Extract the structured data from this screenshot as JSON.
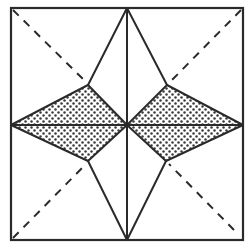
{
  "diagram": {
    "title": "",
    "colors": {
      "background": "#ffffff",
      "stroke": "#2a2a2a",
      "dots": "#3a3a3a"
    },
    "square": {
      "x1": 11,
      "y1": 8,
      "x2": 243,
      "y2": 240
    },
    "center": {
      "x": 127,
      "y": 125
    },
    "inner_vertices": {
      "upper_left": {
        "x": 88,
        "y": 85
      },
      "upper_right": {
        "x": 167,
        "y": 85
      },
      "lower_left": {
        "x": 88,
        "y": 161
      },
      "lower_right": {
        "x": 166,
        "y": 161
      }
    },
    "shaded_regions": [
      {
        "name": "left-diamond",
        "points": "11,125 88,85 127,125 88,161"
      },
      {
        "name": "right-diamond",
        "points": "127,125 167,85 243,125 166,161"
      }
    ],
    "solid_lines": [
      {
        "name": "vertical-center-line",
        "x1": 127,
        "y1": 8,
        "x2": 127,
        "y2": 240
      },
      {
        "name": "horizontal-center-line",
        "x1": 11,
        "y1": 125,
        "x2": 243,
        "y2": 125
      },
      {
        "name": "top-to-upper-left",
        "x1": 127,
        "y1": 8,
        "x2": 88,
        "y2": 85
      },
      {
        "name": "top-to-upper-right",
        "x1": 127,
        "y1": 8,
        "x2": 167,
        "y2": 85
      },
      {
        "name": "bottom-to-lower-left",
        "x1": 127,
        "y1": 240,
        "x2": 88,
        "y2": 161
      },
      {
        "name": "bottom-to-lower-right",
        "x1": 127,
        "y1": 240,
        "x2": 166,
        "y2": 161
      },
      {
        "name": "left-to-upper-left",
        "x1": 11,
        "y1": 125,
        "x2": 88,
        "y2": 85
      },
      {
        "name": "left-to-lower-left",
        "x1": 11,
        "y1": 125,
        "x2": 88,
        "y2": 161
      },
      {
        "name": "center-to-upper-left",
        "x1": 127,
        "y1": 125,
        "x2": 88,
        "y2": 85
      },
      {
        "name": "center-to-lower-left",
        "x1": 127,
        "y1": 125,
        "x2": 88,
        "y2": 161
      },
      {
        "name": "center-to-upper-right",
        "x1": 127,
        "y1": 125,
        "x2": 167,
        "y2": 85
      },
      {
        "name": "center-to-lower-right",
        "x1": 127,
        "y1": 125,
        "x2": 166,
        "y2": 161
      },
      {
        "name": "right-to-upper-right",
        "x1": 243,
        "y1": 125,
        "x2": 167,
        "y2": 85
      },
      {
        "name": "right-to-lower-right",
        "x1": 243,
        "y1": 125,
        "x2": 166,
        "y2": 161
      }
    ],
    "dashed_lines": [
      {
        "name": "dashed-diagonal-top-left",
        "x1": 13,
        "y1": 10,
        "x2": 86,
        "y2": 82
      },
      {
        "name": "dashed-diagonal-top-right",
        "x1": 241,
        "y1": 10,
        "x2": 170,
        "y2": 82
      },
      {
        "name": "dashed-diagonal-bottom-left",
        "x1": 13,
        "y1": 238,
        "x2": 86,
        "y2": 164
      },
      {
        "name": "dashed-diagonal-bottom-right",
        "x1": 234,
        "y1": 230,
        "x2": 169,
        "y2": 164
      }
    ]
  }
}
